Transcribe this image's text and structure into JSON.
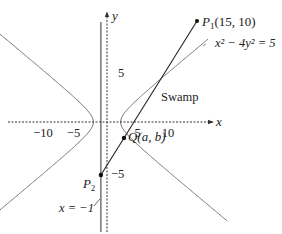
{
  "diagram": {
    "x_axis": {
      "label": "x",
      "ticks": [
        -10,
        -5,
        5,
        10
      ],
      "range": [
        -15,
        17
      ]
    },
    "y_axis": {
      "label": "y",
      "ticks": [
        5,
        -5
      ],
      "range": [
        -10.5,
        11.5
      ]
    },
    "curve": {
      "equation_label": "x² − 4y² = 5",
      "a2": 5,
      "b2": 1.25
    },
    "vertical_line": {
      "label": "x = −1",
      "x": -1
    },
    "points": {
      "P1": {
        "label": "P",
        "sub": "1",
        "coords_label": "(15, 10)",
        "x": 15,
        "y": 10
      },
      "P2": {
        "label": "P",
        "sub": "2",
        "x": -1,
        "y": -2
      },
      "Q": {
        "label": "Q(a, b)",
        "x": 2.5,
        "y": 1
      }
    },
    "region_label": "Swamp",
    "colors": {
      "axis": "#333333",
      "curve": "#777777",
      "segment": "#222222",
      "line": "#444444"
    }
  }
}
